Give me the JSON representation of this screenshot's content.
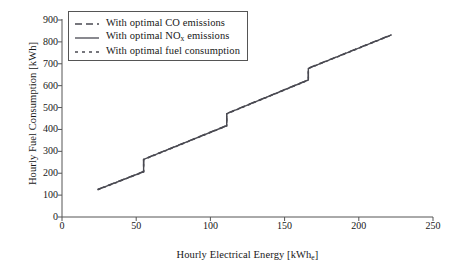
{
  "chart_data": {
    "type": "line",
    "title": "",
    "subtitle": "",
    "xlabel": "Hourly Electrical Energy [kWh",
    "xlabel_sub": "e",
    "xlabel_close": "]",
    "ylabel": "Hourly Fuel Consumption [kWh]",
    "xlim": [
      0,
      250
    ],
    "ylim": [
      0,
      900
    ],
    "xticks": [
      0,
      50,
      100,
      150,
      200,
      250
    ],
    "yticks": [
      0,
      100,
      200,
      300,
      400,
      500,
      600,
      700,
      800,
      900
    ],
    "grid": false,
    "legend_position": "upper-left",
    "axis_color": "#555555",
    "line_color": "#4a4a52",
    "series": [
      {
        "name": "With optimal CO emissions",
        "style": "dashed",
        "dasharray": "7,4",
        "color": "#4a4a52",
        "points": [
          [
            24,
            126
          ],
          [
            55,
            208
          ],
          [
            55,
            264
          ],
          [
            111,
            418
          ],
          [
            111,
            473
          ],
          [
            166,
            627
          ],
          [
            166,
            680
          ],
          [
            222,
            833
          ]
        ]
      },
      {
        "name": "With optimal NOx emissions",
        "name_prefix": "With optimal NO",
        "name_sub": "x",
        "name_suffix": " emissions",
        "style": "solid",
        "dasharray": "",
        "color": "#4a4a52",
        "points": [
          [
            24,
            125
          ],
          [
            55,
            207
          ],
          [
            55,
            263
          ],
          [
            111,
            417
          ],
          [
            111,
            472
          ],
          [
            166,
            626
          ],
          [
            166,
            679
          ],
          [
            222,
            832
          ]
        ]
      },
      {
        "name": "With optimal fuel consumption",
        "style": "dotted",
        "dasharray": "3,3",
        "color": "#4a4a52",
        "points": [
          [
            24,
            124
          ],
          [
            55,
            206
          ],
          [
            55,
            262
          ],
          [
            111,
            416
          ],
          [
            111,
            471
          ],
          [
            166,
            625
          ],
          [
            166,
            678
          ],
          [
            222,
            831
          ]
        ]
      }
    ],
    "annotations": [],
    "step_discontinuities": [
      55,
      111,
      166
    ]
  },
  "legend": {
    "entries": [
      {
        "label": "With optimal CO emissions"
      },
      {
        "label_prefix": "With optimal NO",
        "label_sub": "x",
        "label_suffix": " emissions"
      },
      {
        "label": "With optimal fuel consumption"
      }
    ]
  }
}
